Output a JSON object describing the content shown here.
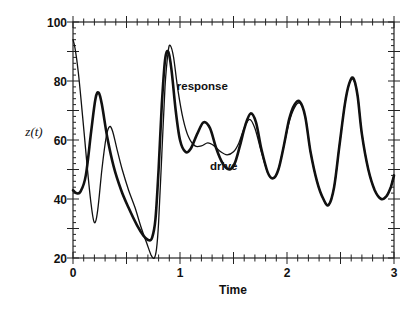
{
  "chart_data": {
    "type": "line",
    "title": "",
    "xlabel": "Time",
    "ylabel": "z(t)",
    "xlim": [
      0,
      3
    ],
    "ylim": [
      20,
      100
    ],
    "xticks": [
      0,
      1,
      2,
      3
    ],
    "xtick_labels": [
      "0",
      "1",
      "2",
      "3"
    ],
    "yticks": [
      20,
      40,
      60,
      80,
      100
    ],
    "ytick_labels": [
      "20",
      "40",
      "60",
      "80",
      "100"
    ],
    "grid": false,
    "legend": "none",
    "annotations": [
      {
        "text": "response",
        "x": 0.97,
        "y": 77
      },
      {
        "text": "drive",
        "x": 1.28,
        "y": 50
      }
    ],
    "series": [
      {
        "name": "drive",
        "style": "thick",
        "x": [
          0,
          0.03,
          0.07,
          0.12,
          0.17,
          0.21,
          0.24,
          0.27,
          0.32,
          0.38,
          0.45,
          0.52,
          0.6,
          0.66,
          0.71,
          0.74,
          0.77,
          0.8,
          0.83,
          0.86,
          0.89,
          0.92,
          0.96,
          1.0,
          1.05,
          1.1,
          1.16,
          1.22,
          1.28,
          1.34,
          1.4,
          1.46,
          1.51,
          1.56,
          1.61,
          1.66,
          1.71,
          1.76,
          1.82,
          1.87,
          1.92,
          1.97,
          2.02,
          2.07,
          2.12,
          2.17,
          2.22,
          2.28,
          2.34,
          2.39,
          2.44,
          2.49,
          2.54,
          2.58,
          2.62,
          2.66,
          2.7,
          2.76,
          2.82,
          2.88,
          2.93,
          2.97,
          3.0
        ],
        "y": [
          43,
          42,
          42.5,
          48,
          63,
          74,
          76,
          72,
          61,
          51,
          43,
          37,
          31,
          27.5,
          26,
          27,
          33,
          50,
          72,
          87,
          90,
          84,
          70,
          60,
          56,
          57,
          62,
          66,
          64,
          57,
          52,
          50,
          52,
          58,
          65,
          69,
          66,
          57,
          49,
          47,
          50,
          58,
          67,
          72,
          73,
          68,
          56,
          46,
          40,
          38,
          44,
          58,
          72,
          79,
          81,
          75,
          62,
          50,
          43,
          40,
          41,
          44,
          48
        ]
      },
      {
        "name": "response",
        "style": "thin",
        "x": [
          0,
          0.02,
          0.05,
          0.09,
          0.13,
          0.17,
          0.2,
          0.23,
          0.27,
          0.31,
          0.34,
          0.37,
          0.41,
          0.46,
          0.52,
          0.58,
          0.64,
          0.69,
          0.73,
          0.76,
          0.78,
          0.8,
          0.83,
          0.86,
          0.89,
          0.91,
          0.94,
          0.98,
          1.03,
          1.08,
          1.14,
          1.2,
          1.26,
          1.32,
          1.38,
          1.44,
          1.5,
          1.55,
          1.6,
          1.65,
          1.7,
          1.76,
          1.82,
          1.87,
          1.92,
          1.97,
          2.02,
          2.07,
          2.12,
          2.17,
          2.22,
          2.28,
          2.34,
          2.39,
          2.44,
          2.49,
          2.54,
          2.58,
          2.62,
          2.66,
          2.7,
          2.76,
          2.82,
          2.88,
          2.93,
          2.97,
          3.0
        ],
        "y": [
          94,
          91,
          83,
          68,
          52,
          38,
          32,
          36,
          50,
          61,
          64.5,
          63,
          57,
          50,
          43,
          37,
          30,
          25,
          21,
          20,
          23,
          32,
          55,
          78,
          90,
          92,
          88,
          77,
          67,
          61,
          58,
          58,
          59,
          58,
          56,
          55,
          56,
          59,
          64,
          67,
          64,
          56,
          49,
          47,
          50,
          58,
          66,
          71,
          72.5,
          68,
          56,
          46,
          40,
          38,
          44,
          58,
          72,
          79,
          80.5,
          75,
          62,
          50,
          43,
          40,
          41,
          44,
          48
        ]
      }
    ]
  }
}
